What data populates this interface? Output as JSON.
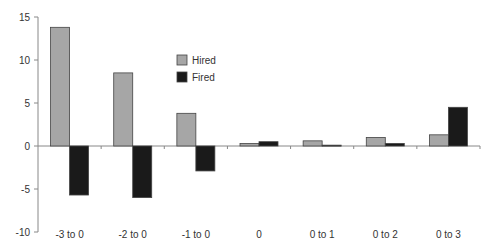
{
  "chart_data": {
    "type": "bar",
    "title": "",
    "xlabel": "",
    "ylabel": "",
    "categories": [
      "-3 to 0",
      "-2 to 0",
      "-1 to 0",
      "0",
      "0 to 1",
      "0 to 2",
      "0 to 3"
    ],
    "series": [
      {
        "name": "Hired",
        "color": "#a6a6a6",
        "values": [
          13.8,
          8.5,
          3.8,
          0.3,
          0.6,
          1.0,
          1.3
        ]
      },
      {
        "name": "Fired",
        "color": "#1a1a1a",
        "values": [
          -5.7,
          -6.0,
          -2.9,
          0.5,
          0.1,
          0.3,
          4.5
        ]
      }
    ],
    "ylim": [
      -10,
      15
    ],
    "yticks": [
      15,
      10,
      5,
      0,
      -5,
      -10
    ],
    "grid": false,
    "legend_position": "upper-center-left",
    "colors": {
      "axis": "#888888",
      "bar_border": "#444444"
    }
  }
}
